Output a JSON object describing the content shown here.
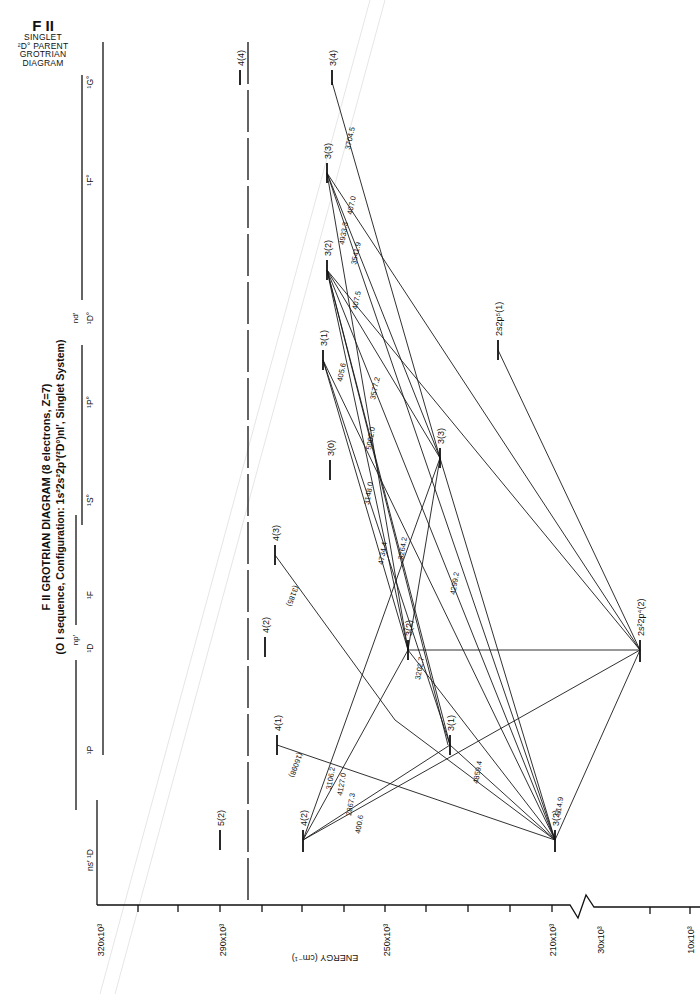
{
  "corner_title": {
    "line1": "F II",
    "line2": "SINGLET",
    "line3": "²D° PARENT",
    "line4": "GROTRIAN",
    "line5": "DIAGRAM"
  },
  "header": {
    "title": "F II GROTRIAN DIAGRAM (8 electrons, Z=7)",
    "subtitle": "(O I sequence, Configuration: 1s²2s²2p³(²D°)nl′, Singlet System)"
  },
  "axis": {
    "label": "ENERGY (cm⁻¹)",
    "ticks": [
      {
        "label": "320x10³",
        "y": 905
      },
      {
        "label": "290x10³",
        "y": 905
      },
      {
        "label": "250x10³",
        "y": 905
      },
      {
        "label": "210x10³",
        "y": 905
      },
      {
        "label": "30x10³",
        "y": 905
      },
      {
        "label": "10x10³",
        "y": 905
      }
    ]
  },
  "columns": [
    {
      "label": "ns′ ¹D",
      "group": ""
    },
    {
      "label": "¹P",
      "group": "np′"
    },
    {
      "label": "¹D",
      "group": "np′"
    },
    {
      "label": "¹F",
      "group": "np′"
    },
    {
      "label": "¹S°",
      "group": "nd′"
    },
    {
      "label": "¹P°",
      "group": "nd′"
    },
    {
      "label": "¹D°",
      "group": "nd′"
    },
    {
      "label": "¹F°",
      "group": "nd′"
    },
    {
      "label": "¹G°",
      "group": "nd′"
    }
  ],
  "levels": [
    {
      "label": "5(2)"
    },
    {
      "label": "4(2)"
    },
    {
      "label": "3(2)"
    },
    {
      "label": "4(1)"
    },
    {
      "label": "3(1)"
    },
    {
      "label": "4(2)"
    },
    {
      "label": "3(2)"
    },
    {
      "label": "4(3)"
    },
    {
      "label": "3(3)"
    },
    {
      "label": "3(0)"
    },
    {
      "label": "3(1)"
    },
    {
      "label": "3(2)"
    },
    {
      "label": "3(3)"
    },
    {
      "label": "4(4)"
    },
    {
      "label": "3(4)"
    },
    {
      "label": "2s2p⁵(1)"
    },
    {
      "label": "2s²2p⁴(2)"
    }
  ],
  "wavelengths": [
    "3704.5",
    "407.0",
    "4933.3",
    "3541.9",
    "407.5",
    "405.6",
    "3577.2",
    "5002.0",
    "3148.0",
    "4734.4",
    "3264.2",
    "4299.2",
    "3202.7",
    "(3185)",
    "(16098)",
    "3106.2",
    "4127.0",
    "2867.3",
    "400.6",
    "4859.4",
    "514.9"
  ]
}
